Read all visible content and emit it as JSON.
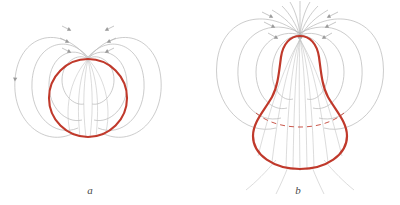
{
  "figure": {
    "kind": "scientific-diagram",
    "background_color": "#ffffff",
    "width": 400,
    "height": 205
  },
  "colors": {
    "drop_outline": "#c0392b",
    "drop_outline_dark": "#b2302a",
    "field_line": "#b6b6b6",
    "field_line_faint": "#c9c9c9",
    "arrow": "#9a9a9a",
    "label_text": "#4a4a4a",
    "dashed_equator": "#c0392b"
  },
  "panels": [
    {
      "id": "a",
      "label": "a",
      "caption_label": "a",
      "shape_name": "sphere",
      "shape_description": "circular drop outline",
      "center_x": 88,
      "center_y": 98,
      "radius": 39,
      "field_line_count": 10,
      "loop_pairs": 3,
      "has_dashed_equator": false
    },
    {
      "id": "b",
      "label": "b",
      "caption_label": "b",
      "shape_name": "teardrop",
      "shape_description": "pear-shaped deformed drop with narrow upper neck and wide lower bulge",
      "center_x": 300,
      "apex_y": 36,
      "bulge_center_y": 122,
      "bulge_radius": 47,
      "neck_half_width": 17,
      "field_line_count": 14,
      "loop_pairs": 4,
      "has_dashed_equator": true
    }
  ],
  "labels": {
    "panel_a": "a",
    "panel_b": "b"
  },
  "legend": {
    "drop_surface": "drop surface",
    "electric_field_lines": "electric field lines",
    "hidden_equator": "hidden equator (dashed)"
  }
}
